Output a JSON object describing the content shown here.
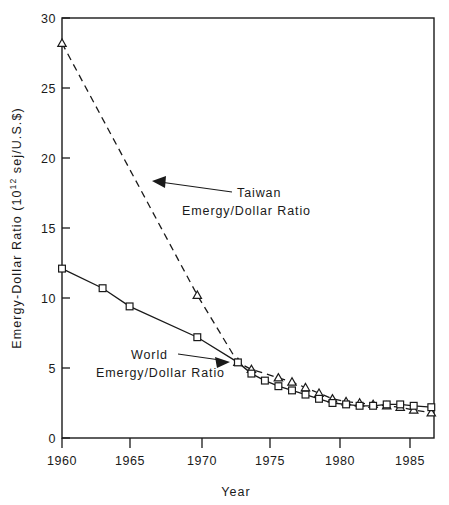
{
  "chart_data": {
    "type": "line",
    "title": "",
    "xlabel": "Year",
    "ylabel": "Emergy-Dollar Ratio (10¹² sej/U.S.$)",
    "ylabel_parts": {
      "main": "Emergy-Dollar Ratio (10",
      "exponent": "12",
      "tail": " sej/U.S.$)"
    },
    "xlim": [
      1960,
      1987.5
    ],
    "ylim": [
      0,
      30
    ],
    "grid": false,
    "legend": "annotations-on-plot",
    "xticks": [
      1960,
      1965,
      1970,
      1975,
      1980,
      1985
    ],
    "xtick_labels": [
      "1960",
      "1965",
      "1970",
      "1975",
      "1980",
      "1985"
    ],
    "yticks": [
      0,
      5,
      10,
      15,
      20,
      25,
      30
    ],
    "ytick_labels": [
      "0",
      "5",
      "10",
      "15",
      "20",
      "25",
      "30"
    ],
    "series": [
      {
        "name": "Taiwan Emergy/Dollar Ratio",
        "marker": "triangle",
        "line_style": "dashed",
        "color": "#1a1a1a",
        "x": [
          1960,
          1970,
          1973,
          1974,
          1976,
          1977,
          1978,
          1979,
          1980,
          1981,
          1982,
          1983,
          1984,
          1985,
          1986,
          1987.3
        ],
        "y": [
          28.2,
          10.2,
          5.4,
          4.9,
          4.3,
          4.0,
          3.6,
          3.2,
          2.8,
          2.6,
          2.5,
          2.4,
          2.3,
          2.2,
          2.0,
          1.8
        ]
      },
      {
        "name": "World Emergy/Dollar Ratio",
        "marker": "square",
        "line_style": "solid",
        "color": "#1a1a1a",
        "x": [
          1960,
          1963,
          1965,
          1970,
          1973,
          1974,
          1975,
          1976,
          1977,
          1978,
          1979,
          1980,
          1981,
          1982,
          1983,
          1984,
          1985,
          1986,
          1987.3
        ],
        "y": [
          12.1,
          10.7,
          9.4,
          7.2,
          5.4,
          4.6,
          4.1,
          3.7,
          3.4,
          3.1,
          2.8,
          2.5,
          2.4,
          2.3,
          2.3,
          2.4,
          2.4,
          2.3,
          2.2
        ]
      }
    ],
    "annotations": [
      {
        "name": "taiwan-annotation",
        "line1": "Taiwan",
        "line2": "Emergy/Dollar Ratio",
        "text_x": 237,
        "text_y": 196,
        "arrow_from": [
          232,
          192
        ],
        "arrow_to": [
          152,
          182
        ]
      },
      {
        "name": "world-annotation",
        "line1": "World",
        "line2": "Emergy/Dollar Ratio",
        "text_x": 96,
        "text_y": 355,
        "arrow_from": [
          178,
          354
        ],
        "arrow_to": [
          228,
          362
        ]
      }
    ]
  }
}
